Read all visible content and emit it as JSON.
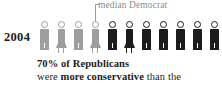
{
  "annotation": {
    "label": "median Democrat",
    "color": "#8d8d8d"
  },
  "year": {
    "label": "2004"
  },
  "caption": {
    "line1": "70% of Republicans",
    "line2_pre": "were ",
    "line2_strong": "more conservative",
    "line2_post": " than the"
  },
  "colors": {
    "light_figure": "#9e9e9e",
    "dark_figure": "#1c1c1c",
    "text": "#1c1c1c",
    "annotation": "#8d8d8d",
    "background": "#ffffff"
  },
  "chart_data": {
    "type": "bar",
    "title": "2004",
    "subtitle": "70% of Republicans were more conservative than the median Democrat",
    "categories": [
      "1",
      "2",
      "3",
      "4",
      "5",
      "6",
      "7",
      "8",
      "9",
      "10",
      "11"
    ],
    "values": [
      1,
      1,
      1,
      1,
      1,
      1,
      1,
      1,
      1,
      1,
      1
    ],
    "series": [
      {
        "name": "people",
        "values": [
          {
            "index": 1,
            "gender": "male",
            "shade": "light",
            "label": ""
          },
          {
            "index": 2,
            "gender": "female",
            "shade": "light",
            "label": ""
          },
          {
            "index": 3,
            "gender": "male",
            "shade": "light",
            "label": ""
          },
          {
            "index": 4,
            "gender": "female",
            "shade": "light",
            "label": "median Democrat"
          },
          {
            "index": 5,
            "gender": "male",
            "shade": "dark",
            "label": ""
          },
          {
            "index": 6,
            "gender": "female",
            "shade": "dark",
            "label": ""
          },
          {
            "index": 7,
            "gender": "male",
            "shade": "dark",
            "label": ""
          },
          {
            "index": 8,
            "gender": "male",
            "shade": "dark",
            "label": ""
          },
          {
            "index": 9,
            "gender": "male",
            "shade": "dark",
            "label": ""
          },
          {
            "index": 10,
            "gender": "male",
            "shade": "dark",
            "label": ""
          },
          {
            "index": 11,
            "gender": "male",
            "shade": "dark",
            "label": ""
          }
        ]
      }
    ],
    "annotations": [
      {
        "text": "median Democrat",
        "points_to_index": 4
      }
    ],
    "xlabel": "",
    "ylabel": "",
    "grid": false,
    "legend": "none"
  }
}
